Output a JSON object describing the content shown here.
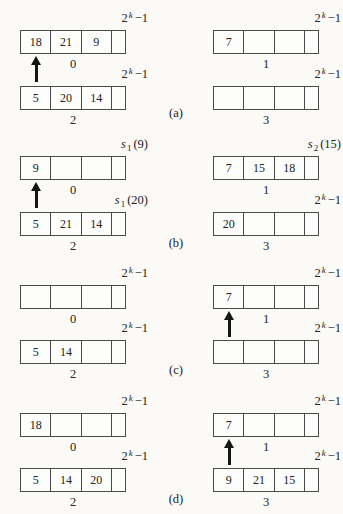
{
  "figure": {
    "sections": [
      {
        "tag": "(a)",
        "arrays": [
          {
            "top": {
              "base": "2",
              "sup": "k",
              "sub": "",
              "rest": "−1"
            },
            "cells": [
              "18",
              "21",
              "9"
            ],
            "bucket": "0",
            "arrow": true
          },
          {
            "top": {
              "base": "2",
              "sup": "k",
              "sub": "",
              "rest": "−1"
            },
            "cells": [
              "7",
              "",
              ""
            ],
            "bucket": "1",
            "arrow": false
          },
          {
            "top": {
              "base": "2",
              "sup": "k",
              "sub": "",
              "rest": "−1"
            },
            "cells": [
              "5",
              "20",
              "14"
            ],
            "bucket": "2",
            "arrow": false
          },
          {
            "top": {
              "base": "2",
              "sup": "k",
              "sub": "",
              "rest": "−1"
            },
            "cells": [
              "",
              "",
              ""
            ],
            "bucket": "3",
            "arrow": false
          }
        ]
      },
      {
        "tag": "(b)",
        "arrays": [
          {
            "top": {
              "base": "s",
              "sup": "",
              "sub": "1",
              "rest": "(9)"
            },
            "cells": [
              "9",
              "",
              ""
            ],
            "bucket": "0",
            "arrow": true
          },
          {
            "top": {
              "base": "s",
              "sup": "",
              "sub": "2",
              "rest": "(15)"
            },
            "cells": [
              "7",
              "15",
              "18"
            ],
            "bucket": "1",
            "arrow": false
          },
          {
            "top": {
              "base": "s",
              "sup": "",
              "sub": "1",
              "rest": "(20)"
            },
            "cells": [
              "5",
              "21",
              "14"
            ],
            "bucket": "2",
            "arrow": false
          },
          {
            "top": {
              "base": "2",
              "sup": "k",
              "sub": "",
              "rest": "−1"
            },
            "cells": [
              "20",
              "",
              ""
            ],
            "bucket": "3",
            "arrow": false
          }
        ]
      },
      {
        "tag": "(c)",
        "arrays": [
          {
            "top": {
              "base": "2",
              "sup": "k",
              "sub": "",
              "rest": "−1"
            },
            "cells": [
              "",
              "",
              ""
            ],
            "bucket": "0",
            "arrow": false
          },
          {
            "top": {
              "base": "2",
              "sup": "k",
              "sub": "",
              "rest": "−1"
            },
            "cells": [
              "7",
              "",
              ""
            ],
            "bucket": "1",
            "arrow": true
          },
          {
            "top": {
              "base": "2",
              "sup": "k",
              "sub": "",
              "rest": "−1"
            },
            "cells": [
              "5",
              "14",
              ""
            ],
            "bucket": "2",
            "arrow": false
          },
          {
            "top": {
              "base": "2",
              "sup": "k",
              "sub": "",
              "rest": "−1"
            },
            "cells": [
              "",
              "",
              ""
            ],
            "bucket": "3",
            "arrow": false
          }
        ]
      },
      {
        "tag": "(d)",
        "arrays": [
          {
            "top": {
              "base": "2",
              "sup": "k",
              "sub": "",
              "rest": "−1"
            },
            "cells": [
              "18",
              "",
              ""
            ],
            "bucket": "0",
            "arrow": false
          },
          {
            "top": {
              "base": "2",
              "sup": "k",
              "sub": "",
              "rest": "−1"
            },
            "cells": [
              "7",
              "",
              ""
            ],
            "bucket": "1",
            "arrow": true
          },
          {
            "top": {
              "base": "2",
              "sup": "k",
              "sub": "",
              "rest": "−1"
            },
            "cells": [
              "5",
              "14",
              "20"
            ],
            "bucket": "2",
            "arrow": false
          },
          {
            "top": {
              "base": "2",
              "sup": "k",
              "sub": "",
              "rest": "−1"
            },
            "cells": [
              "9",
              "21",
              "15"
            ],
            "bucket": "3",
            "arrow": false
          }
        ]
      }
    ]
  }
}
